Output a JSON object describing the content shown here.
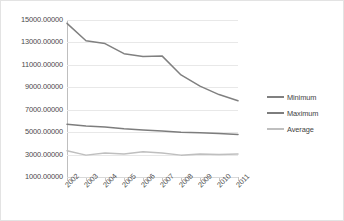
{
  "chart_data": {
    "type": "line",
    "title": "",
    "xlabel": "",
    "ylabel": "",
    "grid": true,
    "legend_position": "right",
    "categories": [
      "2002",
      "2003",
      "2004",
      "2005",
      "2006",
      "2007",
      "2008",
      "2009",
      "2010",
      "2011"
    ],
    "ylim": [
      1000,
      15000
    ],
    "ytick_values": [
      1000,
      3000,
      5000,
      7000,
      9000,
      11000,
      13000,
      15000
    ],
    "ytick_labels": [
      "1000.00000",
      "3000.00000",
      "5000.00000",
      "7000.00000",
      "9000.00000",
      "11000.00000",
      "13000.00000",
      "15000.00000"
    ],
    "xtick_labels": [
      "2002",
      "2003",
      "2004",
      "2005",
      "2006",
      "2007",
      "2008",
      "2009",
      "2010",
      "2011"
    ],
    "series": [
      {
        "name": "Minimum",
        "color": "#808080",
        "values": [
          14700,
          13150,
          12900,
          12000,
          11750,
          11800,
          10100,
          9100,
          8350,
          7800
        ]
      },
      {
        "name": "Maximum",
        "color": "#7d7d7d",
        "values": [
          5700,
          5550,
          5450,
          5300,
          5200,
          5100,
          5000,
          4950,
          4880,
          4800
        ]
      },
      {
        "name": "Average",
        "color": "#bfbfbf",
        "values": [
          3350,
          2950,
          3150,
          3050,
          3250,
          3150,
          2950,
          3050,
          3000,
          3050
        ]
      }
    ]
  },
  "legend": {
    "items": [
      {
        "label": "Minimum",
        "color": "#808080"
      },
      {
        "label": "Maximum",
        "color": "#7d7d7d"
      },
      {
        "label": "Average",
        "color": "#bfbfbf"
      }
    ]
  }
}
